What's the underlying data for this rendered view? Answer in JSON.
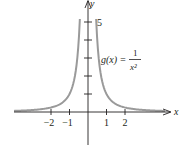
{
  "chart_data": {
    "type": "line",
    "title": "",
    "function_label": {
      "lhs": "g(x) = ",
      "numerator": "1",
      "denominator": "x²"
    },
    "xlabel": "x",
    "ylabel": "y",
    "x_ticks": [
      -2,
      -1,
      1,
      2
    ],
    "x_tick_labels": [
      "−2",
      "−1",
      "1",
      "2"
    ],
    "y_ticks": [
      1,
      2,
      3,
      4,
      5
    ],
    "y_tick_labels": {
      "5": "5"
    },
    "xlim": [
      -4,
      4.5
    ],
    "ylim": [
      -1.8,
      6.2
    ],
    "grid": false,
    "series": [
      {
        "name": "g(x) = 1/x^2",
        "color": "#9a9a9a",
        "points": [
          [
            -4,
            0.0625
          ],
          [
            -3,
            0.111
          ],
          [
            -2,
            0.25
          ],
          [
            -1.5,
            0.444
          ],
          [
            -1,
            1
          ],
          [
            -0.75,
            1.778
          ],
          [
            -0.6,
            2.778
          ],
          [
            -0.5,
            4
          ],
          [
            -0.45,
            4.94
          ],
          [
            0.45,
            4.94
          ],
          [
            0.5,
            4
          ],
          [
            0.6,
            2.778
          ],
          [
            0.75,
            1.778
          ],
          [
            1,
            1
          ],
          [
            1.5,
            0.444
          ],
          [
            2,
            0.25
          ],
          [
            3,
            0.111
          ],
          [
            4,
            0.0625
          ]
        ]
      }
    ],
    "axis_color": "#231f20",
    "curve_color": "#9a9a9a"
  }
}
